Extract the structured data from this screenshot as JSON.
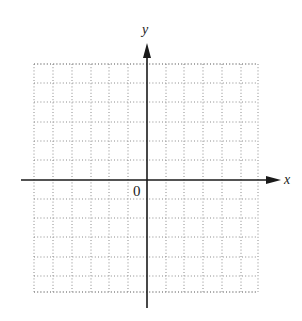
{
  "diagram": {
    "type": "coordinate-plane",
    "labels": {
      "x_axis": "x",
      "y_axis": "y",
      "origin": "0"
    },
    "grid": {
      "style": "dotted",
      "x_lines": [
        34,
        53,
        72,
        91,
        109,
        128,
        166,
        184,
        203,
        222,
        241,
        258
      ],
      "y_lines": [
        64,
        83,
        102,
        122,
        141,
        160,
        199,
        218,
        237,
        257,
        276,
        292
      ],
      "left": 34,
      "right": 258,
      "top": 64,
      "bottom": 292,
      "units_left_of_origin": 6,
      "units_right_of_origin": 6,
      "units_above_origin": 6,
      "units_below_origin": 6
    },
    "axes": {
      "origin_x": 147,
      "origin_y": 180,
      "x_axis_start": 21,
      "x_axis_end": 281,
      "y_axis_top": 43,
      "y_axis_bottom": 308,
      "x_arrow": "right",
      "y_arrow": "up"
    },
    "colors": {
      "axis": "#1a1a1a",
      "grid": "#8a8a8a",
      "background": "#ffffff"
    }
  }
}
